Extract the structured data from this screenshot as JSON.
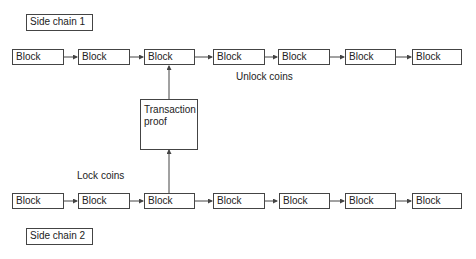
{
  "diagram": {
    "title_top": "Side chain 1",
    "title_bottom": "Side chain 2",
    "block_label": "Block",
    "top_chain": {
      "name": "Side chain 1",
      "blocks": [
        "Block",
        "Block",
        "Block",
        "Block",
        "Block",
        "Block",
        "Block"
      ],
      "annotation": "Unlock coins"
    },
    "bottom_chain": {
      "name": "Side chain 2",
      "blocks": [
        "Block",
        "Block",
        "Block",
        "Block",
        "Block",
        "Block",
        "Block"
      ],
      "annotation": "Lock coins"
    },
    "proof": {
      "label": "Transaction proof"
    },
    "line_color": "#444444"
  }
}
